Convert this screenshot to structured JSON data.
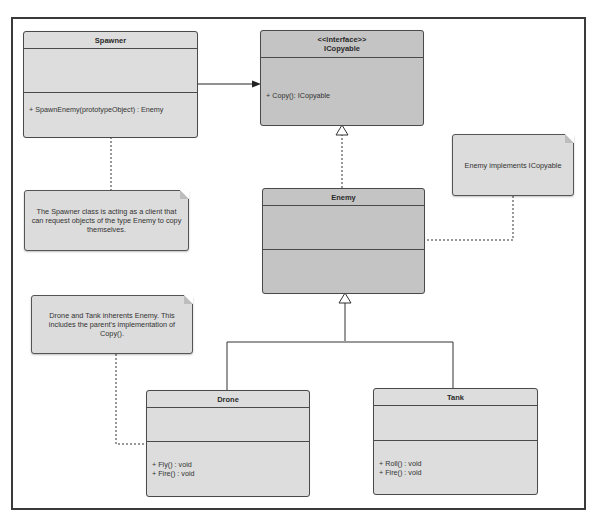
{
  "diagram": {
    "type": "UML class diagram (Prototype pattern)",
    "classes": {
      "spawner": {
        "name": "Spawner",
        "operations": [
          "+ SpawnEnemy(prototypeObject) : Enemy"
        ]
      },
      "icopyable": {
        "stereotype": "<<interface>>",
        "name": "ICopyable",
        "operations": [
          "+ Copy(): ICopyable"
        ]
      },
      "enemy": {
        "name": "Enemy",
        "operations": []
      },
      "drone": {
        "name": "Drone",
        "operations": [
          "+ Fly() : void",
          "+ Fire() : void"
        ]
      },
      "tank": {
        "name": "Tank",
        "operations": [
          "+ Roll() : void",
          "+ Fire() : void"
        ]
      }
    },
    "notes": {
      "spawner_note": "The Spawner class is acting as a client that can request objects of the type Enemy to copy themselves.",
      "enemy_note": "Enemy implements ICopyable",
      "inherit_note": "Drone and Tank inherents Enemy. This includes the parent's implementation of Copy()."
    },
    "relationships": [
      {
        "from": "Spawner",
        "to": "ICopyable",
        "type": "association"
      },
      {
        "from": "Enemy",
        "to": "ICopyable",
        "type": "realization"
      },
      {
        "from": "Drone",
        "to": "Enemy",
        "type": "generalization"
      },
      {
        "from": "Tank",
        "to": "Enemy",
        "type": "generalization"
      }
    ]
  }
}
